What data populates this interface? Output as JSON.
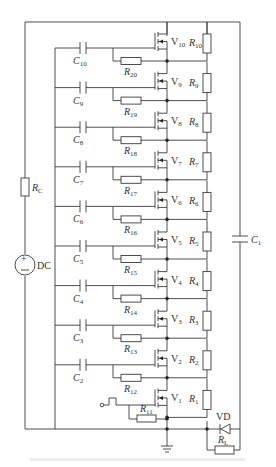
{
  "diagram": {
    "components": {
      "source": {
        "label": "DC",
        "symbol": "dc-source"
      },
      "charge_resistor": {
        "label": "R",
        "sub": "C"
      },
      "output_cap": {
        "label": "C",
        "sub": "1"
      },
      "diode": {
        "label": "VD"
      },
      "load": {
        "label": "R",
        "sub": "L"
      }
    },
    "stages": [
      {
        "mosfet": "V",
        "mosfet_sub": "1",
        "drain_res": "R",
        "drain_res_sub": "1",
        "gate_res": "R",
        "gate_res_sub": "11",
        "cap": null,
        "cap_sub": null
      },
      {
        "mosfet": "V",
        "mosfet_sub": "2",
        "drain_res": "R",
        "drain_res_sub": "2",
        "gate_res": "R",
        "gate_res_sub": "12",
        "cap": "C",
        "cap_sub": "2"
      },
      {
        "mosfet": "V",
        "mosfet_sub": "3",
        "drain_res": "R",
        "drain_res_sub": "3",
        "gate_res": "R",
        "gate_res_sub": "13",
        "cap": "C",
        "cap_sub": "3"
      },
      {
        "mosfet": "V",
        "mosfet_sub": "4",
        "drain_res": "R",
        "drain_res_sub": "4",
        "gate_res": "R",
        "gate_res_sub": "14",
        "cap": "C",
        "cap_sub": "4"
      },
      {
        "mosfet": "V",
        "mosfet_sub": "5",
        "drain_res": "R",
        "drain_res_sub": "5",
        "gate_res": "R",
        "gate_res_sub": "15",
        "cap": "C",
        "cap_sub": "5"
      },
      {
        "mosfet": "V",
        "mosfet_sub": "6",
        "drain_res": "R",
        "drain_res_sub": "6",
        "gate_res": "R",
        "gate_res_sub": "16",
        "cap": "C",
        "cap_sub": "6"
      },
      {
        "mosfet": "V",
        "mosfet_sub": "7",
        "drain_res": "R",
        "drain_res_sub": "7",
        "gate_res": "R",
        "gate_res_sub": "17",
        "cap": "C",
        "cap_sub": "7"
      },
      {
        "mosfet": "V",
        "mosfet_sub": "8",
        "drain_res": "R",
        "drain_res_sub": "8",
        "gate_res": "R",
        "gate_res_sub": "18",
        "cap": "C",
        "cap_sub": "8"
      },
      {
        "mosfet": "V",
        "mosfet_sub": "9",
        "drain_res": "R",
        "drain_res_sub": "9",
        "gate_res": "R",
        "gate_res_sub": "19",
        "cap": "C",
        "cap_sub": "9"
      },
      {
        "mosfet": "V",
        "mosfet_sub": "10",
        "drain_res": "R",
        "drain_res_sub": "10",
        "gate_res": "R",
        "gate_res_sub": "20",
        "cap": "C",
        "cap_sub": "10"
      }
    ],
    "trigger": {
      "symbol": "pulse-input"
    },
    "colors": {
      "line": "#3a3a3a",
      "background": "#ffffff"
    }
  }
}
